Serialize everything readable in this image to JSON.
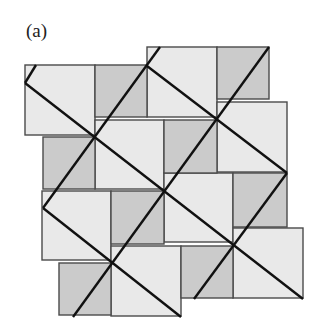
{
  "figure": {
    "label": "(a)",
    "colors": {
      "large_square": "#e9e9e9",
      "small_square": "#cbcbcb",
      "square_border": "#4a4a4a",
      "grid_line": "#111111"
    },
    "large_squares": [
      [
        25,
        65,
        70
      ],
      [
        147,
        47,
        70
      ],
      [
        95,
        120,
        69
      ],
      [
        217,
        102,
        70
      ],
      [
        42,
        191,
        69
      ],
      [
        164,
        173,
        69
      ],
      [
        111,
        246,
        70
      ],
      [
        233,
        228,
        70
      ]
    ],
    "small_squares": [
      [
        95,
        65,
        52
      ],
      [
        217,
        47,
        52
      ],
      [
        43,
        137,
        52
      ],
      [
        164,
        120,
        53
      ],
      [
        111,
        191,
        53
      ],
      [
        233,
        173,
        54
      ],
      [
        59,
        263,
        52
      ],
      [
        181,
        246,
        52
      ]
    ],
    "grid_lines": [
      [
        25,
        83,
        303,
        299
      ],
      [
        147,
        66,
        287,
        173
      ],
      [
        43,
        208,
        181,
        317
      ],
      [
        73,
        317,
        269,
        47
      ],
      [
        43,
        208,
        160,
        47
      ],
      [
        194,
        299,
        287,
        173
      ],
      [
        25,
        83,
        36,
        65
      ]
    ]
  }
}
